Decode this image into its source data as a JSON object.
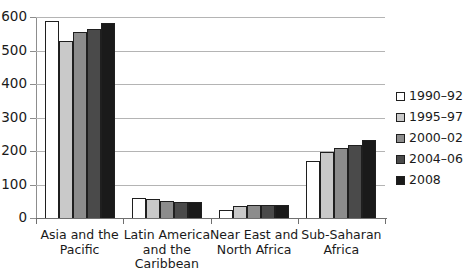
{
  "chart_data": {
    "type": "bar",
    "title": "",
    "subtitle": "",
    "xlabel": "",
    "ylabel": "",
    "ylim": [
      0,
      600
    ],
    "yticks": [
      0,
      100,
      200,
      300,
      400,
      500,
      600
    ],
    "ytick_labels": [
      "0",
      "100",
      "200",
      "300",
      "400",
      "500",
      "600"
    ],
    "grid": true,
    "grid_axis": "y",
    "legend_position": "right",
    "categories": [
      "Asia and the\nPacific",
      "Latin America\nand the\nCaribbean",
      "Near East and\nNorth Africa",
      "Sub-Saharan\nAfrica"
    ],
    "category_lines": [
      [
        "Asia and the",
        "Pacific"
      ],
      [
        "Latin America",
        "and the",
        "Caribbean"
      ],
      [
        "Near East and",
        "North Africa"
      ],
      [
        "Sub-Saharan",
        "Africa"
      ]
    ],
    "series": [
      {
        "name": "1990–92",
        "color": "#ffffff",
        "values": [
          587,
          60,
          25,
          170
        ]
      },
      {
        "name": "1995–97",
        "color": "#c9c9c9",
        "values": [
          529,
          58,
          36,
          198
        ]
      },
      {
        "name": "2000–02",
        "color": "#8c8c8c",
        "values": [
          554,
          52,
          38,
          209
        ]
      },
      {
        "name": "2004–06",
        "color": "#4a4a4a",
        "values": [
          564,
          48,
          39,
          217
        ]
      },
      {
        "name": "2008",
        "color": "#1a1a1a",
        "values": [
          583,
          47,
          40,
          234
        ]
      }
    ]
  }
}
